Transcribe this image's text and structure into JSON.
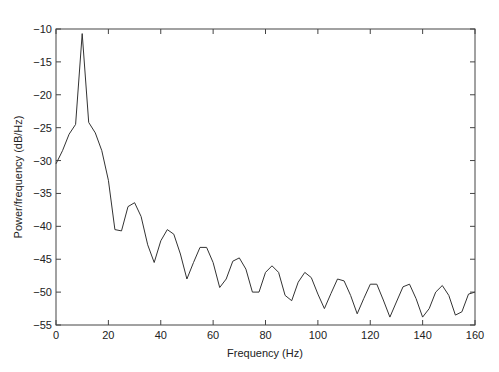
{
  "chart_data": {
    "type": "line",
    "title": "",
    "xlabel": "Frequency (Hz)",
    "ylabel": "Power/frequency (dB/Hz)",
    "xlim": [
      0,
      160
    ],
    "ylim": [
      -55,
      -10
    ],
    "grid": false,
    "legend": null,
    "x_ticks": [
      0,
      20,
      40,
      60,
      80,
      100,
      120,
      140,
      160
    ],
    "y_ticks": [
      -10,
      -15,
      -20,
      -25,
      -30,
      -35,
      -40,
      -45,
      -50,
      -55
    ],
    "x_tick_labels": [
      "0",
      "20",
      "40",
      "60",
      "80",
      "100",
      "120",
      "140",
      "160"
    ],
    "y_tick_labels": [
      "-10",
      "-15",
      "-20",
      "-25",
      "-30",
      "-35",
      "-40",
      "-45",
      "-50",
      "-55"
    ],
    "line_color": "#333333",
    "series": [
      {
        "name": "PSD",
        "x": [
          0,
          2.5,
          5,
          7.5,
          10,
          12.5,
          15,
          17.5,
          20,
          22.5,
          25,
          27.5,
          30,
          32.5,
          35,
          37.5,
          40,
          42.5,
          45,
          47.5,
          50,
          52.5,
          55,
          57.5,
          60,
          62.5,
          65,
          67.5,
          70,
          72.5,
          75,
          77.5,
          80,
          82.5,
          85,
          87.5,
          90,
          92.5,
          95,
          97.5,
          100,
          102.5,
          105,
          107.5,
          110,
          112.5,
          115,
          117.5,
          120,
          122.5,
          125,
          127.5,
          130,
          132.5,
          135,
          137.5,
          140,
          142.5,
          145,
          147.5,
          150,
          152.5,
          155,
          157.5,
          160
        ],
        "values": [
          -30.5,
          -28.5,
          -26,
          -24.5,
          -10.7,
          -24.2,
          -25.8,
          -28.5,
          -33,
          -40.5,
          -40.7,
          -37,
          -36.4,
          -38.5,
          -42.8,
          -45.5,
          -42.2,
          -40.5,
          -41.2,
          -44.2,
          -48,
          -45.5,
          -43.2,
          -43.2,
          -45.5,
          -49.3,
          -48,
          -45.3,
          -44.8,
          -46.5,
          -50,
          -50,
          -47,
          -46,
          -47,
          -50.5,
          -51.3,
          -48.5,
          -47,
          -47.8,
          -50.3,
          -52.5,
          -50.2,
          -48,
          -48.3,
          -50.5,
          -53.3,
          -51,
          -48.8,
          -48.8,
          -51.2,
          -53.8,
          -51.5,
          -49.2,
          -48.8,
          -51,
          -53.8,
          -52.5,
          -50,
          -49,
          -50.5,
          -53.5,
          -53,
          -50.3,
          -50
        ]
      }
    ]
  }
}
